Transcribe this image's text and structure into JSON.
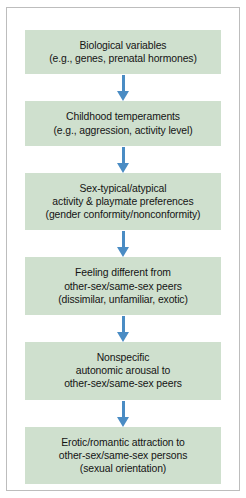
{
  "figure": {
    "type": "flowchart",
    "orientation": "vertical-top-to-bottom",
    "colors": {
      "node_fill": "#cfe0ce",
      "arrow": "#4a8cc4",
      "text": "#141414",
      "frame": "#bdbdbd",
      "background": "#ffffff"
    },
    "nodes": [
      {
        "id": "biological-variables",
        "lines": [
          "Biological variables",
          "(e.g., genes, prenatal hormones)"
        ]
      },
      {
        "id": "childhood-temperaments",
        "lines": [
          "Childhood temperaments",
          "(e.g., aggression, activity level)"
        ]
      },
      {
        "id": "sex-typical-atypical-preferences",
        "lines": [
          "Sex-typical/atypical",
          "activity & playmate preferences",
          "(gender conformity/nonconformity)"
        ]
      },
      {
        "id": "feeling-different",
        "lines": [
          "Feeling different from",
          "other-sex/same-sex peers",
          "(dissimilar, unfamiliar, exotic)"
        ]
      },
      {
        "id": "nonspecific-autonomic-arousal",
        "lines": [
          "Nonspecific",
          "autonomic arousal to",
          "other-sex/same-sex peers"
        ]
      },
      {
        "id": "erotic-romantic-attraction",
        "lines": [
          "Erotic/romantic attraction to",
          "other-sex/same-sex persons",
          "(sexual orientation)"
        ]
      }
    ],
    "connectors": [
      {
        "id": "arrow-1",
        "icon": "arrow-down-icon",
        "from": "biological-variables",
        "to": "childhood-temperaments"
      },
      {
        "id": "arrow-2",
        "icon": "arrow-down-icon",
        "from": "childhood-temperaments",
        "to": "sex-typical-atypical-preferences"
      },
      {
        "id": "arrow-3",
        "icon": "arrow-down-icon",
        "from": "sex-typical-atypical-preferences",
        "to": "feeling-different"
      },
      {
        "id": "arrow-4",
        "icon": "arrow-down-icon",
        "from": "feeling-different",
        "to": "nonspecific-autonomic-arousal"
      },
      {
        "id": "arrow-5",
        "icon": "arrow-down-icon",
        "from": "nonspecific-autonomic-arousal",
        "to": "erotic-romantic-attraction"
      }
    ]
  }
}
